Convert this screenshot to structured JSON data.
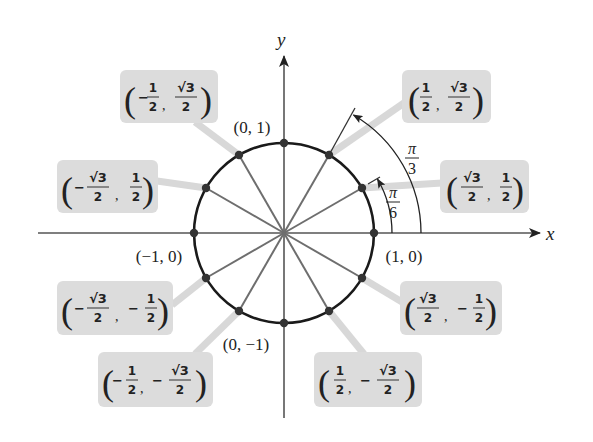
{
  "diagram": {
    "axes": {
      "x_label": "x",
      "y_label": "y"
    },
    "axis_points": [
      {
        "label": "(0, 1)",
        "angle_deg": 90
      },
      {
        "label": "(−1, 0)",
        "angle_deg": 180
      },
      {
        "label": "(1, 0)",
        "angle_deg": 0
      },
      {
        "label": "(0, −1)",
        "angle_deg": 270
      }
    ],
    "angle_markers": [
      {
        "label_num": "π",
        "label_den": "6",
        "angle_deg": 30
      },
      {
        "label_num": "π",
        "label_den": "3",
        "angle_deg": 60
      }
    ],
    "callouts": [
      {
        "id": "q1-60",
        "angle_deg": 60,
        "x_sign": "",
        "x_num": "1",
        "x_den": "2",
        "y_sign": "",
        "y_num": "√3",
        "y_den": "2",
        "text": "(1/2, √3/2)"
      },
      {
        "id": "q1-30",
        "angle_deg": 30,
        "x_sign": "",
        "x_num": "√3",
        "x_den": "2",
        "y_sign": "",
        "y_num": "1",
        "y_den": "2",
        "text": "(√3/2, 1/2)"
      },
      {
        "id": "q2-120",
        "angle_deg": 120,
        "x_sign": "−",
        "x_num": "1",
        "x_den": "2",
        "y_sign": "",
        "y_num": "√3",
        "y_den": "2",
        "text": "(−1/2, √3/2)"
      },
      {
        "id": "q2-150",
        "angle_deg": 150,
        "x_sign": "−",
        "x_num": "√3",
        "x_den": "2",
        "y_sign": "",
        "y_num": "1",
        "y_den": "2",
        "text": "(−√3/2, 1/2)"
      },
      {
        "id": "q3-210",
        "angle_deg": 210,
        "x_sign": "−",
        "x_num": "√3",
        "x_den": "2",
        "y_sign": "−",
        "y_num": "1",
        "y_den": "2",
        "text": "(−√3/2, −1/2)"
      },
      {
        "id": "q3-240",
        "angle_deg": 240,
        "x_sign": "−",
        "x_num": "1",
        "x_den": "2",
        "y_sign": "−",
        "y_num": "√3",
        "y_den": "2",
        "text": "(−1/2, −√3/2)"
      },
      {
        "id": "q4-330",
        "angle_deg": 330,
        "x_sign": "",
        "x_num": "√3",
        "x_den": "2",
        "y_sign": "−",
        "y_num": "1",
        "y_den": "2",
        "text": "(√3/2, −1/2)"
      },
      {
        "id": "q4-300",
        "angle_deg": 300,
        "x_sign": "",
        "x_num": "1",
        "x_den": "2",
        "y_sign": "−",
        "y_num": "√3",
        "y_den": "2",
        "text": "(1/2, −√3/2)"
      }
    ],
    "spoke_angles_deg": [
      0,
      30,
      60,
      90,
      120,
      150,
      180,
      210,
      240,
      270,
      300,
      330
    ],
    "colors": {
      "circle": "#1a1a1a",
      "spokes": "#6e6e6e",
      "axes": "#555555",
      "dots": "#333333",
      "callout_bg": "#dcdcdc",
      "leader": "#d6d6d6"
    }
  }
}
